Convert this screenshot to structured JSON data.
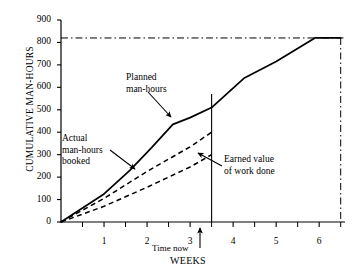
{
  "chart_data": {
    "type": "line",
    "title": "",
    "xlabel": "WEEKS",
    "ylabel": "CUMULATIVE MAN-HOURS",
    "xlim": [
      0,
      6.6
    ],
    "ylim": [
      0,
      900
    ],
    "ytick_values": [
      0,
      100,
      200,
      300,
      400,
      500,
      600,
      700,
      800,
      900
    ],
    "ytick_labels": [
      "0",
      "100",
      "200",
      "300",
      "400",
      "500",
      "600",
      "700",
      "800",
      "900"
    ],
    "xtick_values": [
      1,
      2,
      3,
      4,
      5,
      6
    ],
    "xtick_labels": [
      "1",
      "2",
      "3",
      "4",
      "5",
      "6"
    ],
    "xminor_ticks": [
      0.5,
      1.5,
      2.5,
      3.5,
      4.5,
      5.5,
      6.5
    ],
    "grid": false,
    "legend": "none",
    "series": [
      {
        "name": "Planned man-hours",
        "style": "solid",
        "color": "#000000",
        "points": [
          [
            0,
            0
          ],
          [
            1.0,
            125
          ],
          [
            1.6,
            230
          ],
          [
            2.1,
            330
          ],
          [
            2.6,
            435
          ],
          [
            3.0,
            465
          ],
          [
            3.5,
            510
          ],
          [
            4.25,
            640
          ],
          [
            5.0,
            715
          ],
          [
            5.9,
            820
          ],
          [
            6.5,
            820
          ]
        ]
      },
      {
        "name": "Actual man-hours booked",
        "style": "dashed",
        "color": "#000000",
        "points": [
          [
            0,
            0
          ],
          [
            1.0,
            105
          ],
          [
            2.0,
            225
          ],
          [
            3.0,
            335
          ],
          [
            3.5,
            400
          ]
        ]
      },
      {
        "name": "Earned value of work done",
        "style": "dashed",
        "color": "#000000",
        "points": [
          [
            0,
            0
          ],
          [
            1.0,
            70
          ],
          [
            2.0,
            155
          ],
          [
            3.0,
            245
          ],
          [
            3.5,
            300
          ]
        ]
      }
    ],
    "reference_lines": [
      {
        "name": "budget-total-line",
        "orientation": "horizontal",
        "value": 820,
        "style": "dash-dot",
        "color": "#000000"
      },
      {
        "name": "planned-completion-line",
        "orientation": "vertical",
        "value": 6.5,
        "style": "dash-dot",
        "color": "#000000"
      },
      {
        "name": "time-now-line",
        "orientation": "vertical",
        "value": 3.5,
        "style": "solid",
        "color": "#000000"
      }
    ],
    "annotations": [
      {
        "name": "planned-man-hours-label",
        "text_lines": [
          "Planned",
          "man-hours"
        ],
        "target": [
          3.0,
          465
        ]
      },
      {
        "name": "actual-man-hours-label",
        "text_lines": [
          "Actual",
          "man-hours",
          "booked"
        ],
        "target": [
          2.15,
          240
        ]
      },
      {
        "name": "earned-value-label",
        "text_lines": [
          "Earned value",
          "of work done"
        ],
        "target": [
          3.4,
          295
        ]
      },
      {
        "name": "time-now-label",
        "text_lines": [
          "Time now"
        ],
        "target": [
          3.5,
          0
        ]
      }
    ]
  },
  "axis": {
    "y_title": "CUMULATIVE MAN-HOURS",
    "x_title": "WEEKS"
  },
  "labels": {
    "planned_line1": "Planned",
    "planned_line2": "man-hours",
    "actual_line1": "Actual",
    "actual_line2": "man-hours",
    "actual_line3": "booked",
    "earned_line1": "Earned value",
    "earned_line2": "of work done",
    "time_now": "Time now"
  },
  "colors": {
    "ink": "#000000",
    "background": "#ffffff"
  }
}
